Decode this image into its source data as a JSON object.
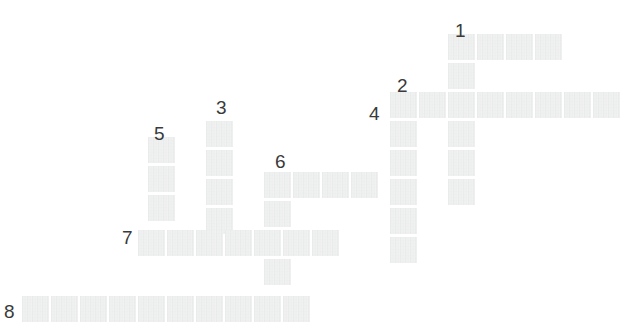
{
  "puzzle": {
    "title": "Crossword Grid",
    "type": "crossword-grid",
    "canvas": {
      "width": 638,
      "height": 331
    },
    "background_color": "#ffffff",
    "cell": {
      "fill_color": "#eceeed",
      "width": 27,
      "height": 26,
      "pitch_x": 29,
      "pitch_y": 29
    },
    "number_color": "#3a3a3a",
    "origin": {
      "x": 22,
      "y": 27
    },
    "grid_columns": 21,
    "grid_rows": 10,
    "clue_numbers": [
      {
        "label": "1",
        "x": 455,
        "y": 21
      },
      {
        "label": "2",
        "x": 397,
        "y": 76
      },
      {
        "label": "3",
        "x": 216,
        "y": 98
      },
      {
        "label": "4",
        "x": 369,
        "y": 104
      },
      {
        "label": "5",
        "x": 154,
        "y": 124
      },
      {
        "label": "6",
        "x": 275,
        "y": 152
      },
      {
        "label": "7",
        "x": 122,
        "y": 228
      },
      {
        "label": "8",
        "x": 4,
        "y": 302
      }
    ],
    "cells": [
      {
        "x": 448,
        "y": 34
      },
      {
        "x": 477,
        "y": 34
      },
      {
        "x": 506,
        "y": 34
      },
      {
        "x": 535,
        "y": 34
      },
      {
        "x": 448,
        "y": 63
      },
      {
        "x": 390,
        "y": 92
      },
      {
        "x": 419,
        "y": 92
      },
      {
        "x": 448,
        "y": 92
      },
      {
        "x": 477,
        "y": 92
      },
      {
        "x": 506,
        "y": 92
      },
      {
        "x": 535,
        "y": 92
      },
      {
        "x": 564,
        "y": 92
      },
      {
        "x": 593,
        "y": 92
      },
      {
        "x": 390,
        "y": 121
      },
      {
        "x": 448,
        "y": 121
      },
      {
        "x": 206,
        "y": 121
      },
      {
        "x": 148,
        "y": 137
      },
      {
        "x": 206,
        "y": 150
      },
      {
        "x": 390,
        "y": 150
      },
      {
        "x": 448,
        "y": 150
      },
      {
        "x": 148,
        "y": 166
      },
      {
        "x": 206,
        "y": 179
      },
      {
        "x": 264,
        "y": 172
      },
      {
        "x": 293,
        "y": 172
      },
      {
        "x": 322,
        "y": 172
      },
      {
        "x": 351,
        "y": 172
      },
      {
        "x": 390,
        "y": 179
      },
      {
        "x": 448,
        "y": 179
      },
      {
        "x": 148,
        "y": 195
      },
      {
        "x": 206,
        "y": 208
      },
      {
        "x": 264,
        "y": 201
      },
      {
        "x": 390,
        "y": 208
      },
      {
        "x": 138,
        "y": 230
      },
      {
        "x": 167,
        "y": 230
      },
      {
        "x": 196,
        "y": 230
      },
      {
        "x": 225,
        "y": 230
      },
      {
        "x": 254,
        "y": 230
      },
      {
        "x": 283,
        "y": 230
      },
      {
        "x": 312,
        "y": 230
      },
      {
        "x": 390,
        "y": 237
      },
      {
        "x": 264,
        "y": 259
      },
      {
        "x": 22,
        "y": 296
      },
      {
        "x": 51,
        "y": 296
      },
      {
        "x": 80,
        "y": 296
      },
      {
        "x": 109,
        "y": 296
      },
      {
        "x": 138,
        "y": 296
      },
      {
        "x": 167,
        "y": 296
      },
      {
        "x": 196,
        "y": 296
      },
      {
        "x": 225,
        "y": 296
      },
      {
        "x": 254,
        "y": 296
      },
      {
        "x": 283,
        "y": 296
      }
    ]
  }
}
